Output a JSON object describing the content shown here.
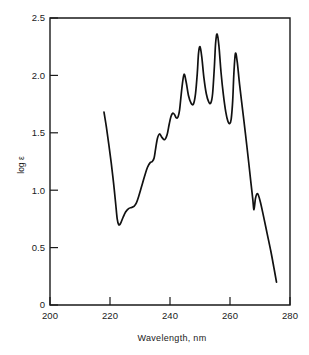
{
  "figure": {
    "axis_titles": {
      "x": "Wavelength,  nm",
      "y": "log ε"
    },
    "caption": "",
    "x_tick_labels": [
      "200",
      "220",
      "240",
      "260",
      "280"
    ],
    "y_tick_labels": [
      "0",
      "0.5",
      "1.0",
      "1.5",
      "2.0",
      "2.5"
    ],
    "line_color": "#111111",
    "background_color": "#ffffff"
  },
  "chart_data": {
    "type": "line",
    "title": "",
    "subtitle": "",
    "xlabel": "Wavelength,  nm",
    "ylabel": "log ε",
    "xlim": [
      200,
      280
    ],
    "ylim": [
      0,
      2.5
    ],
    "xticks": [
      200,
      220,
      240,
      260,
      280
    ],
    "yticks": [
      0,
      0.5,
      1.0,
      1.5,
      2.0,
      2.5
    ],
    "grid": false,
    "legend": null,
    "annotations": [],
    "series": [
      {
        "name": "absorption spectrum",
        "color": "#111111",
        "x": [
          218.0,
          218.8,
          219.6,
          220.4,
          221.2,
          221.9,
          222.4,
          222.9,
          223.5,
          224.3,
          225.2,
          226.2,
          227.2,
          228.0,
          228.8,
          229.6,
          230.5,
          231.5,
          232.5,
          233.4,
          234.1,
          234.7,
          235.2,
          235.8,
          236.5,
          237.3,
          238.2,
          239.0,
          239.7,
          240.3,
          240.9,
          241.5,
          242.1,
          242.7,
          243.2,
          243.6,
          244.1,
          244.7,
          245.4,
          246.2,
          247.0,
          247.8,
          248.5,
          249.1,
          249.5,
          250.0,
          250.6,
          251.3,
          252.1,
          252.9,
          253.6,
          254.2,
          254.8,
          255.2,
          255.7,
          256.3,
          257.0,
          257.8,
          258.6,
          259.3,
          259.9,
          260.4,
          260.9,
          261.3,
          261.8,
          262.4,
          263.2,
          264.2,
          265.2,
          266.2,
          267.0,
          267.6,
          268.0,
          268.5,
          269.2,
          270.1,
          271.2,
          272.4,
          273.6,
          274.6,
          275.5
        ],
        "y": [
          1.68,
          1.55,
          1.4,
          1.24,
          1.06,
          0.88,
          0.75,
          0.7,
          0.71,
          0.76,
          0.81,
          0.84,
          0.85,
          0.86,
          0.89,
          0.95,
          1.03,
          1.12,
          1.2,
          1.24,
          1.25,
          1.28,
          1.36,
          1.45,
          1.49,
          1.46,
          1.44,
          1.48,
          1.57,
          1.64,
          1.67,
          1.66,
          1.63,
          1.64,
          1.7,
          1.8,
          1.92,
          2.01,
          1.94,
          1.82,
          1.76,
          1.75,
          1.84,
          2.02,
          2.19,
          2.25,
          2.16,
          1.98,
          1.84,
          1.77,
          1.76,
          1.84,
          2.08,
          2.28,
          2.36,
          2.26,
          2.03,
          1.83,
          1.68,
          1.6,
          1.58,
          1.62,
          1.78,
          2.02,
          2.19,
          2.12,
          1.92,
          1.7,
          1.48,
          1.25,
          1.06,
          0.92,
          0.83,
          0.93,
          0.97,
          0.9,
          0.77,
          0.62,
          0.47,
          0.33,
          0.2
        ]
      }
    ]
  }
}
